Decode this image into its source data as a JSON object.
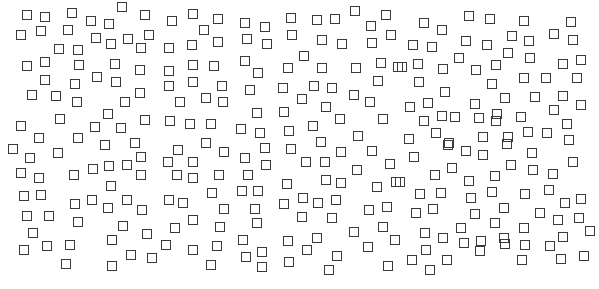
{
  "canvas": {
    "width": 599,
    "height": 289,
    "background": "#ffffff"
  },
  "shape": {
    "type": "square-outline",
    "size": 10,
    "stroke": "#3a3a3a",
    "stroke_width": 1.5
  },
  "squares": [
    [
      27,
      15
    ],
    [
      45,
      17
    ],
    [
      72,
      13
    ],
    [
      91,
      21
    ],
    [
      21,
      35
    ],
    [
      41,
      31
    ],
    [
      68,
      30
    ],
    [
      96,
      38
    ],
    [
      59,
      49
    ],
    [
      78,
      50
    ],
    [
      27,
      66
    ],
    [
      45,
      62
    ],
    [
      79,
      65
    ],
    [
      97,
      77
    ],
    [
      45,
      80
    ],
    [
      75,
      84
    ],
    [
      32,
      95
    ],
    [
      56,
      96
    ],
    [
      77,
      102
    ],
    [
      60,
      119
    ],
    [
      21,
      126
    ],
    [
      95,
      127
    ],
    [
      39,
      138
    ],
    [
      78,
      138
    ],
    [
      13,
      149
    ],
    [
      30,
      158
    ],
    [
      58,
      153
    ],
    [
      21,
      173
    ],
    [
      39,
      178
    ],
    [
      74,
      175
    ],
    [
      93,
      169
    ],
    [
      24,
      196
    ],
    [
      41,
      195
    ],
    [
      75,
      204
    ],
    [
      92,
      200
    ],
    [
      27,
      216
    ],
    [
      49,
      216
    ],
    [
      78,
      222
    ],
    [
      33,
      233
    ],
    [
      24,
      250
    ],
    [
      47,
      246
    ],
    [
      70,
      245
    ],
    [
      66,
      264
    ],
    [
      122,
      7
    ],
    [
      145,
      15
    ],
    [
      172,
      21
    ],
    [
      193,
      14
    ],
    [
      109,
      24
    ],
    [
      149,
      35
    ],
    [
      111,
      44
    ],
    [
      128,
      39
    ],
    [
      141,
      48
    ],
    [
      169,
      48
    ],
    [
      192,
      45
    ],
    [
      115,
      64
    ],
    [
      140,
      70
    ],
    [
      169,
      71
    ],
    [
      193,
      65
    ],
    [
      116,
      82
    ],
    [
      140,
      93
    ],
    [
      169,
      86
    ],
    [
      193,
      82
    ],
    [
      125,
      102
    ],
    [
      180,
      102
    ],
    [
      108,
      114
    ],
    [
      121,
      128
    ],
    [
      145,
      120
    ],
    [
      170,
      121
    ],
    [
      190,
      124
    ],
    [
      105,
      145
    ],
    [
      135,
      143
    ],
    [
      141,
      157
    ],
    [
      178,
      150
    ],
    [
      109,
      166
    ],
    [
      127,
      165
    ],
    [
      141,
      175
    ],
    [
      168,
      162
    ],
    [
      193,
      162
    ],
    [
      177,
      175
    ],
    [
      193,
      178
    ],
    [
      111,
      186
    ],
    [
      127,
      200
    ],
    [
      142,
      210
    ],
    [
      169,
      200
    ],
    [
      183,
      203
    ],
    [
      108,
      208
    ],
    [
      123,
      226
    ],
    [
      147,
      234
    ],
    [
      175,
      228
    ],
    [
      193,
      220
    ],
    [
      112,
      240
    ],
    [
      166,
      245
    ],
    [
      131,
      255
    ],
    [
      152,
      258
    ],
    [
      193,
      250
    ],
    [
      112,
      266
    ],
    [
      218,
      19
    ],
    [
      204,
      30
    ],
    [
      218,
      42
    ],
    [
      245,
      23
    ],
    [
      265,
      27
    ],
    [
      291,
      18
    ],
    [
      247,
      39
    ],
    [
      267,
      44
    ],
    [
      292,
      35
    ],
    [
      214,
      66
    ],
    [
      245,
      61
    ],
    [
      258,
      73
    ],
    [
      288,
      68
    ],
    [
      222,
      86
    ],
    [
      250,
      90
    ],
    [
      283,
      88
    ],
    [
      206,
      98
    ],
    [
      223,
      102
    ],
    [
      257,
      113
    ],
    [
      284,
      112
    ],
    [
      211,
      124
    ],
    [
      241,
      129
    ],
    [
      260,
      133
    ],
    [
      289,
      131
    ],
    [
      206,
      143
    ],
    [
      224,
      152
    ],
    [
      245,
      158
    ],
    [
      265,
      148
    ],
    [
      291,
      149
    ],
    [
      266,
      165
    ],
    [
      219,
      175
    ],
    [
      248,
      175
    ],
    [
      212,
      193
    ],
    [
      242,
      191
    ],
    [
      258,
      191
    ],
    [
      287,
      184
    ],
    [
      224,
      209
    ],
    [
      255,
      209
    ],
    [
      284,
      204
    ],
    [
      220,
      227
    ],
    [
      257,
      223
    ],
    [
      217,
      246
    ],
    [
      243,
      240
    ],
    [
      288,
      241
    ],
    [
      246,
      257
    ],
    [
      262,
      252
    ],
    [
      211,
      265
    ],
    [
      262,
      267
    ],
    [
      289,
      262
    ],
    [
      317,
      20
    ],
    [
      335,
      19
    ],
    [
      355,
      11
    ],
    [
      386,
      15
    ],
    [
      371,
      26
    ],
    [
      322,
      40
    ],
    [
      342,
      44
    ],
    [
      372,
      43
    ],
    [
      391,
      35
    ],
    [
      304,
      56
    ],
    [
      322,
      68
    ],
    [
      356,
      68
    ],
    [
      381,
      63
    ],
    [
      398,
      67
    ],
    [
      314,
      86
    ],
    [
      332,
      88
    ],
    [
      354,
      95
    ],
    [
      378,
      81
    ],
    [
      302,
      99
    ],
    [
      326,
      107
    ],
    [
      370,
      102
    ],
    [
      340,
      119
    ],
    [
      383,
      119
    ],
    [
      313,
      126
    ],
    [
      358,
      136
    ],
    [
      321,
      142
    ],
    [
      341,
      152
    ],
    [
      372,
      151
    ],
    [
      306,
      162
    ],
    [
      325,
      162
    ],
    [
      357,
      170
    ],
    [
      390,
      164
    ],
    [
      326,
      180
    ],
    [
      341,
      183
    ],
    [
      377,
      187
    ],
    [
      396,
      182
    ],
    [
      303,
      198
    ],
    [
      318,
      203
    ],
    [
      336,
      200
    ],
    [
      302,
      217
    ],
    [
      332,
      218
    ],
    [
      369,
      210
    ],
    [
      387,
      207
    ],
    [
      354,
      232
    ],
    [
      383,
      227
    ],
    [
      317,
      238
    ],
    [
      395,
      240
    ],
    [
      307,
      250
    ],
    [
      368,
      247
    ],
    [
      337,
      256
    ],
    [
      388,
      266
    ],
    [
      329,
      270
    ],
    [
      424,
      23
    ],
    [
      442,
      30
    ],
    [
      469,
      16
    ],
    [
      490,
      19
    ],
    [
      413,
      45
    ],
    [
      432,
      47
    ],
    [
      466,
      41
    ],
    [
      487,
      45
    ],
    [
      402,
      67
    ],
    [
      418,
      64
    ],
    [
      443,
      69
    ],
    [
      459,
      58
    ],
    [
      476,
      70
    ],
    [
      496,
      65
    ],
    [
      419,
      82
    ],
    [
      492,
      84
    ],
    [
      445,
      92
    ],
    [
      410,
      107
    ],
    [
      428,
      103
    ],
    [
      475,
      104
    ],
    [
      497,
      114
    ],
    [
      424,
      121
    ],
    [
      442,
      116
    ],
    [
      455,
      117
    ],
    [
      479,
      118
    ],
    [
      496,
      121
    ],
    [
      409,
      139
    ],
    [
      436,
      133
    ],
    [
      449,
      143
    ],
    [
      483,
      137
    ],
    [
      448,
      145
    ],
    [
      466,
      151
    ],
    [
      483,
      155
    ],
    [
      414,
      157
    ],
    [
      452,
      168
    ],
    [
      435,
      175
    ],
    [
      469,
      181
    ],
    [
      400,
      182
    ],
    [
      495,
      176
    ],
    [
      420,
      194
    ],
    [
      441,
      193
    ],
    [
      471,
      198
    ],
    [
      492,
      192
    ],
    [
      416,
      213
    ],
    [
      433,
      209
    ],
    [
      475,
      214
    ],
    [
      461,
      228
    ],
    [
      495,
      223
    ],
    [
      425,
      233
    ],
    [
      443,
      238
    ],
    [
      464,
      243
    ],
    [
      481,
      241
    ],
    [
      426,
      250
    ],
    [
      480,
      251
    ],
    [
      412,
      260
    ],
    [
      447,
      260
    ],
    [
      430,
      270
    ],
    [
      524,
      21
    ],
    [
      571,
      22
    ],
    [
      512,
      36
    ],
    [
      529,
      41
    ],
    [
      554,
      34
    ],
    [
      573,
      40
    ],
    [
      508,
      53
    ],
    [
      530,
      58
    ],
    [
      563,
      64
    ],
    [
      581,
      60
    ],
    [
      524,
      78
    ],
    [
      546,
      78
    ],
    [
      577,
      78
    ],
    [
      505,
      98
    ],
    [
      535,
      97
    ],
    [
      563,
      96
    ],
    [
      581,
      105
    ],
    [
      554,
      110
    ],
    [
      521,
      117
    ],
    [
      567,
      124
    ],
    [
      508,
      137
    ],
    [
      528,
      132
    ],
    [
      547,
      133
    ],
    [
      569,
      140
    ],
    [
      507,
      144
    ],
    [
      532,
      153
    ],
    [
      511,
      165
    ],
    [
      533,
      170
    ],
    [
      553,
      174
    ],
    [
      573,
      162
    ],
    [
      525,
      194
    ],
    [
      549,
      190
    ],
    [
      565,
      203
    ],
    [
      581,
      199
    ],
    [
      504,
      208
    ],
    [
      540,
      213
    ],
    [
      558,
      220
    ],
    [
      579,
      218
    ],
    [
      524,
      228
    ],
    [
      590,
      231
    ],
    [
      504,
      238
    ],
    [
      525,
      245
    ],
    [
      550,
      246
    ],
    [
      563,
      237
    ],
    [
      522,
      260
    ],
    [
      561,
      259
    ],
    [
      584,
      256
    ],
    [
      505,
      244
    ]
  ]
}
